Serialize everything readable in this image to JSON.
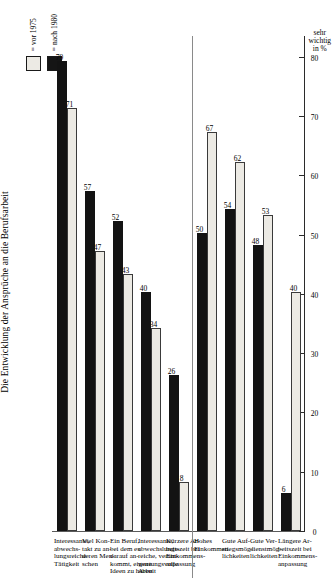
{
  "chart_data": {
    "type": "bar",
    "title": "Die Entwicklung der Ansprüche an die Berufsarbeit",
    "xlabel": "",
    "ylabel": "sehr wichtig in %",
    "ylim": [
      0,
      80
    ],
    "yticks": [
      "80",
      "70",
      "60",
      "50",
      "40",
      "30",
      "20",
      "10",
      "0"
    ],
    "grid": false,
    "orientation": "horizontal-rotated",
    "legend_position": "top-right",
    "legend": [
      {
        "label": "= vor 1975",
        "swatch": "light"
      },
      {
        "label": "= nach 1980",
        "swatch": "dark"
      }
    ],
    "series": [
      {
        "name": "vor 1975",
        "values": [
          71,
          47,
          43,
          34,
          8,
          67,
          62,
          53,
          40
        ]
      },
      {
        "name": "nach 1980",
        "values": [
          79,
          57,
          52,
          40,
          26,
          50,
          54,
          48,
          6
        ]
      }
    ],
    "categories": [
      "Interessante, abwechslungsreiche Tätigkeit",
      "Viel Kontakt zu anderen Menschen",
      "Ein Beruf, bei dem es darauf ankommt, eigene Ideen zu haben",
      "Interessante, abwechslungsreiche, verantwortungsvolle Arbeit",
      "Kürzere Arbeitszeit bei Einkommensanpassung",
      "Hohes Einkommen",
      "Gute Aufstiegsmöglichkeiten",
      "Gute Verdienstmöglichkeiten",
      "Längere Arbeitszeit bei Einkommensanpassung"
    ],
    "bars": [
      {
        "category": "Interessante, abwechslungsreiche Tätigkeit",
        "lines": [
          "Interessante,",
          "abwechs-",
          "lungsreiche",
          "Tätigkeit"
        ],
        "vor_1975": 71,
        "nach_1980": 79,
        "group": 1
      },
      {
        "category": "Viel Kontakt zu anderen Menschen",
        "lines": [
          "Viel Kon-",
          "takt zu an-",
          "deren Men-",
          "schen"
        ],
        "vor_1975": 47,
        "nach_1980": 57,
        "group": 1
      },
      {
        "category": "Ein Beruf, bei dem es darauf ankommt, eigene Ideen zu haben",
        "lines": [
          "Ein Beruf,",
          "bei dem es",
          "darauf an-",
          "kommt, eigene",
          "Ideen zu haben"
        ],
        "vor_1975": 43,
        "nach_1980": 52,
        "group": 1
      },
      {
        "category": "Interessante, abwechslungsreiche, verantwortungsvolle Arbeit",
        "lines": [
          "Interessante,",
          "abwechslungs-",
          "reiche, verant-",
          "wortungsvolle",
          "Arbeit"
        ],
        "vor_1975": 34,
        "nach_1980": 40,
        "group": 1
      },
      {
        "category": "Kürzere Arbeitszeit bei Einkommensanpassung",
        "lines": [
          "Kürzere Ar-",
          "beitszeit bei",
          "Einkommens-",
          "anpassung"
        ],
        "vor_1975": 8,
        "nach_1980": 26,
        "group": 1
      },
      {
        "category": "Hohes Einkommen",
        "lines": [
          "Hohes",
          "Einkommen"
        ],
        "vor_1975": 67,
        "nach_1980": 50,
        "group": 2
      },
      {
        "category": "Gute Aufstiegsmöglichkeiten",
        "lines": [
          "Gute Auf-",
          "stiegsmög-",
          "lichkeiten"
        ],
        "vor_1975": 62,
        "nach_1980": 54,
        "group": 2
      },
      {
        "category": "Gute Verdienstmöglichkeiten",
        "lines": [
          "Gute Ver-",
          "dienstmög-",
          "lichkeiten"
        ],
        "vor_1975": 53,
        "nach_1980": 48,
        "group": 2
      },
      {
        "category": "Längere Arbeitszeit bei Einkommensanpassung",
        "lines": [
          "Längere Ar-",
          "beitszeit bei",
          "Einkommens-",
          "anpassung"
        ],
        "vor_1975": 40,
        "nach_1980": 6,
        "group": 2
      }
    ],
    "colors": {
      "vor_1975": "#eceae4",
      "nach_1980": "#131313",
      "axis": "#2b2b2b",
      "divider": "#8a8a8a",
      "text": "#000000"
    }
  }
}
